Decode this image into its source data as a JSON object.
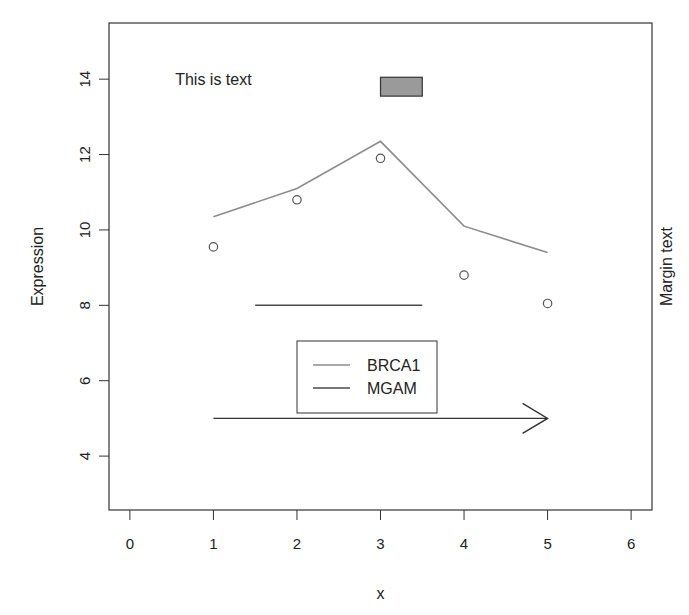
{
  "chart_data": {
    "type": "line",
    "title": "",
    "xlabel": "x",
    "ylabel": "Expression",
    "xlim": [
      -0.25,
      6.25
    ],
    "ylim": [
      2.57,
      15.49
    ],
    "xticks": [
      0,
      1,
      2,
      3,
      4,
      5,
      6
    ],
    "yticks": [
      4,
      6,
      8,
      10,
      12,
      14
    ],
    "grid": false,
    "legend_position": "inside-center-bottom",
    "series": [
      {
        "name": "BRCA1",
        "kind": "line",
        "color": "#8c8c8c",
        "x": [
          1,
          2,
          3,
          4,
          5
        ],
        "y": [
          10.35,
          11.1,
          12.35,
          10.1,
          9.4
        ]
      },
      {
        "name": "points",
        "kind": "scatter",
        "marker": "open-circle",
        "color": "#555555",
        "x": [
          1,
          2,
          3,
          4,
          5
        ],
        "y": [
          9.55,
          10.8,
          11.9,
          8.8,
          8.05
        ]
      },
      {
        "name": "MGAM",
        "kind": "segment",
        "color": "#4a4a4a",
        "x": [
          1.5,
          3.5
        ],
        "y": [
          8,
          8
        ]
      }
    ],
    "annotations": [
      {
        "type": "text",
        "text": "This is text",
        "x": 1,
        "y": 14
      },
      {
        "type": "rect",
        "x0": 3,
        "y0": 13.55,
        "x1": 3.5,
        "y1": 14.05,
        "fill": "#9a9a9a",
        "stroke": "#333333"
      },
      {
        "type": "arrow",
        "x0": 1,
        "y0": 5,
        "x1": 5,
        "y1": 5,
        "color": "#333333"
      },
      {
        "type": "margin-text",
        "side": "right",
        "text": "Margin text"
      }
    ],
    "legend": [
      {
        "label": "BRCA1",
        "color": "#8c8c8c"
      },
      {
        "label": "MGAM",
        "color": "#4a4a4a"
      }
    ]
  },
  "layout": {
    "plot_left": 109,
    "plot_right": 652,
    "plot_top": 23,
    "plot_bottom": 510,
    "legend_box": {
      "x": 297,
      "y": 341,
      "w": 140,
      "h": 72
    }
  }
}
